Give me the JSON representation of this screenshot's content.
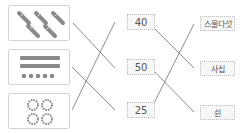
{
  "worksheet": {
    "pictures": [
      {
        "id": "pic-1",
        "description": "5 bundles of ten sticks",
        "icon": "ten-stick-bundle-icon",
        "count": 5
      },
      {
        "id": "pic-2",
        "description": "2 ten-bead bars and 5 single beads",
        "icon": "bead-bar-icon"
      },
      {
        "id": "pic-3",
        "description": "4 rings of ten beads",
        "icon": "bead-ring-icon",
        "count": 4
      }
    ],
    "numbers": [
      "40",
      "50",
      "25"
    ],
    "words": [
      "스물다섯",
      "사십",
      "쉰"
    ],
    "connections_left": [
      {
        "from": "pic-1",
        "to": "50"
      },
      {
        "from": "pic-2",
        "to": "25"
      },
      {
        "from": "pic-3",
        "to": "40"
      }
    ],
    "connections_right": [
      {
        "from": "40",
        "to": "사십"
      },
      {
        "from": "50",
        "to": "쉰"
      },
      {
        "from": "25",
        "to": "스물다섯"
      }
    ],
    "colors": {
      "line": "#6f6f6f",
      "box_border": "#d4d4d4",
      "icon": "#8a8a8a"
    }
  }
}
